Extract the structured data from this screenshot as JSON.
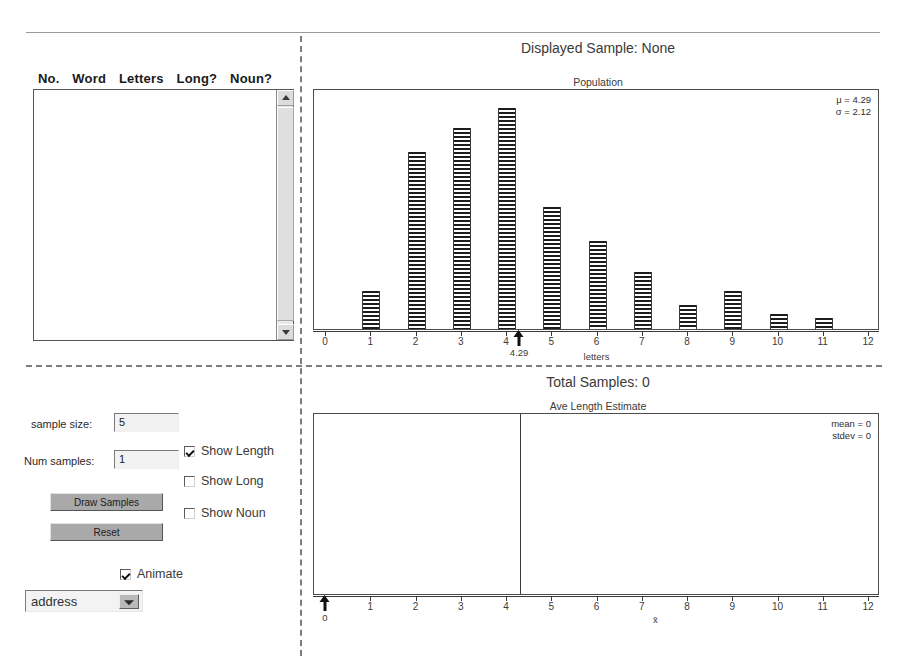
{
  "word_table": {
    "headers": [
      "No.",
      "Word",
      "Letters",
      "Long?",
      "Noun?"
    ],
    "rows": []
  },
  "controls": {
    "sample_size_label": "sample size:",
    "sample_size_value": "5",
    "num_samples_label": "Num samples:",
    "num_samples_value": "1",
    "draw_samples_label": "Draw Samples",
    "reset_label": "Reset",
    "checkboxes": [
      {
        "label": "Show Length",
        "checked": true
      },
      {
        "label": "Show Long",
        "checked": false
      },
      {
        "label": "Show Noun",
        "checked": false
      }
    ],
    "animate_label": "Animate",
    "animate_checked": true,
    "dataset_select_value": "address"
  },
  "top_panel": {
    "status": "Displayed Sample: None"
  },
  "bottom_panel": {
    "status": "Total Samples: 0"
  },
  "chart_data": [
    {
      "type": "bar",
      "title": "Population",
      "xlabel": "letters",
      "ylabel": "",
      "categories": [
        "1",
        "2",
        "3",
        "4",
        "5",
        "6",
        "7",
        "8",
        "9",
        "10",
        "11"
      ],
      "values": [
        17,
        80,
        91,
        100,
        55,
        40,
        26,
        11,
        17,
        7,
        5
      ],
      "x_ticks": [
        "0",
        "1",
        "2",
        "3",
        "4",
        "5",
        "6",
        "7",
        "8",
        "9",
        "10",
        "11",
        "12"
      ],
      "xlim": [
        0,
        12
      ],
      "ylim": [
        0,
        105
      ],
      "grid": false,
      "legend": "none",
      "annotations": {
        "mu_label": "μ = 4.29",
        "sigma_label": "σ = 2.12",
        "mu_value": 4.29,
        "sigma_value": 2.12,
        "marker_value": "4.29"
      }
    },
    {
      "type": "bar",
      "title": "Ave Length Estimate",
      "xlabel": "x̄",
      "ylabel": "",
      "categories": [],
      "values": [],
      "x_ticks": [
        "0",
        "1",
        "2",
        "3",
        "4",
        "5",
        "6",
        "7",
        "8",
        "9",
        "10",
        "11",
        "12"
      ],
      "xlim": [
        0,
        12
      ],
      "ylim": [
        0,
        100
      ],
      "grid": false,
      "legend": "none",
      "annotations": {
        "mean_label": "mean = 0",
        "stdev_label": "stdev = 0",
        "mean_value": 0,
        "stdev_value": 0,
        "reference_line_value": 4.29,
        "marker_value": "0"
      }
    }
  ]
}
